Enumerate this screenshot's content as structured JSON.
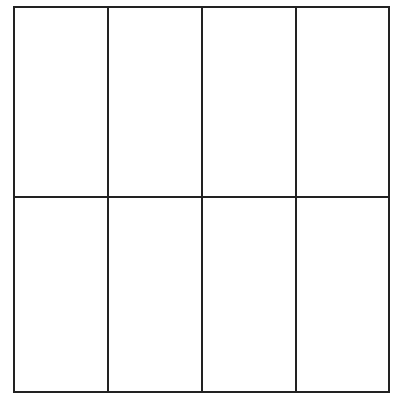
{
  "diagram": {
    "type": "grid",
    "rows": 2,
    "columns": 4,
    "stroke_color": "#222222",
    "background": "#ffffff",
    "bounds": {
      "left": 14,
      "top": 7,
      "right": 389,
      "bottom": 392
    },
    "vertical_lines_x": [
      108,
      202,
      296
    ],
    "horizontal_lines_y": [
      197
    ],
    "cells": [
      {
        "row": 1,
        "col": 1
      },
      {
        "row": 1,
        "col": 2
      },
      {
        "row": 1,
        "col": 3
      },
      {
        "row": 1,
        "col": 4
      },
      {
        "row": 2,
        "col": 1
      },
      {
        "row": 2,
        "col": 2
      },
      {
        "row": 2,
        "col": 3
      },
      {
        "row": 2,
        "col": 4
      }
    ]
  }
}
